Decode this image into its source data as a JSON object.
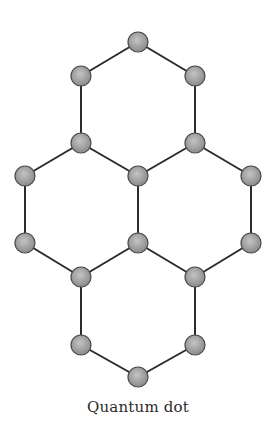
{
  "diagram": {
    "caption": "Quantum dot",
    "colors": {
      "bond": "#2b2b2b",
      "atom_fill_light": "#c4c4c4",
      "atom_fill_dark": "#8a8a8a",
      "atom_stroke": "#4a4a4a"
    },
    "atom_radius": 10,
    "atoms": [
      {
        "id": "a1",
        "x": 138,
        "y": 42
      },
      {
        "id": "a2",
        "x": 81,
        "y": 76
      },
      {
        "id": "a3",
        "x": 195,
        "y": 76
      },
      {
        "id": "a4",
        "x": 81,
        "y": 143
      },
      {
        "id": "a5",
        "x": 195,
        "y": 143
      },
      {
        "id": "a6",
        "x": 25,
        "y": 176
      },
      {
        "id": "a7",
        "x": 138,
        "y": 176
      },
      {
        "id": "a8",
        "x": 251,
        "y": 176
      },
      {
        "id": "a9",
        "x": 25,
        "y": 243
      },
      {
        "id": "a10",
        "x": 138,
        "y": 243
      },
      {
        "id": "a11",
        "x": 251,
        "y": 243
      },
      {
        "id": "a12",
        "x": 81,
        "y": 277
      },
      {
        "id": "a13",
        "x": 195,
        "y": 277
      },
      {
        "id": "a14",
        "x": 81,
        "y": 345
      },
      {
        "id": "a15",
        "x": 195,
        "y": 345
      },
      {
        "id": "a16",
        "x": 138,
        "y": 377
      }
    ],
    "bonds": [
      [
        "a1",
        "a2"
      ],
      [
        "a1",
        "a3"
      ],
      [
        "a2",
        "a4"
      ],
      [
        "a3",
        "a5"
      ],
      [
        "a4",
        "a7"
      ],
      [
        "a5",
        "a7"
      ],
      [
        "a4",
        "a6"
      ],
      [
        "a5",
        "a8"
      ],
      [
        "a6",
        "a9"
      ],
      [
        "a7",
        "a10"
      ],
      [
        "a8",
        "a11"
      ],
      [
        "a9",
        "a12"
      ],
      [
        "a10",
        "a12"
      ],
      [
        "a10",
        "a13"
      ],
      [
        "a11",
        "a13"
      ],
      [
        "a12",
        "a14"
      ],
      [
        "a13",
        "a15"
      ],
      [
        "a14",
        "a16"
      ],
      [
        "a15",
        "a16"
      ]
    ]
  }
}
